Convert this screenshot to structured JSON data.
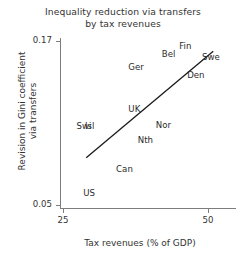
{
  "chart_data": {
    "type": "scatter",
    "title": "Inequality reduction via transfers by tax revenues",
    "title_lines": [
      "Inequality reduction via transfers",
      "by tax revenues"
    ],
    "xlabel": "Tax revenues (% of GDP)",
    "ylabel": "Revision in Gini coefficient via transfers",
    "ylabel_lines": [
      "Revision in Gini coefficient",
      "via transfers"
    ],
    "xlim": [
      25,
      55.5
    ],
    "ylim": [
      0.05,
      0.178
    ],
    "xticks": [
      25,
      50
    ],
    "xticklabels": [
      "25",
      "50"
    ],
    "yticks": [
      0.05,
      0.17
    ],
    "yticklabels": [
      "0.05",
      "0.17"
    ],
    "grid": false,
    "legend": "none",
    "point_style": "text-label-only",
    "points": [
      {
        "label": "Fin",
        "x": 46.1,
        "y": 0.1665
      },
      {
        "label": "Bel",
        "x": 43.2,
        "y": 0.1605
      },
      {
        "label": "Swe",
        "x": 50.5,
        "y": 0.1585
      },
      {
        "label": "Ger",
        "x": 37.6,
        "y": 0.151
      },
      {
        "label": "Den",
        "x": 47.9,
        "y": 0.145
      },
      {
        "label": "UK",
        "x": 37.3,
        "y": 0.1205
      },
      {
        "label": "Swi",
        "x": 28.6,
        "y": 0.108
      },
      {
        "label": "Isl",
        "x": 29.6,
        "y": 0.108
      },
      {
        "label": "Nor",
        "x": 42.3,
        "y": 0.1085
      },
      {
        "label": "Nth",
        "x": 39.2,
        "y": 0.0975
      },
      {
        "label": "Can",
        "x": 35.6,
        "y": 0.076
      },
      {
        "label": "US",
        "x": 29.5,
        "y": 0.0585
      }
    ],
    "trend_line": {
      "name": "fitted regression line",
      "x_start": 29.0,
      "y_start": 0.0845,
      "x_end": 50.9,
      "y_end": 0.1625
    }
  }
}
